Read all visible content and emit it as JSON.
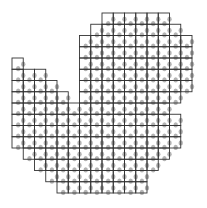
{
  "diagram": {
    "type": "grid-mask",
    "cell_size": 11.25,
    "origin": {
      "x": 12,
      "y": 13
    },
    "line_color": "#333333",
    "fill_color": "#ffffff",
    "dot_color": "#9a9a9a",
    "rows": [
      {
        "r": 0,
        "cols": [
          [
            8,
            13
          ]
        ]
      },
      {
        "r": 1,
        "cols": [
          [
            7,
            14
          ]
        ]
      },
      {
        "r": 2,
        "cols": [
          [
            6,
            15
          ]
        ]
      },
      {
        "r": 3,
        "cols": [
          [
            6,
            15
          ]
        ]
      },
      {
        "r": 4,
        "cols": [
          [
            0,
            0
          ],
          [
            6,
            15
          ]
        ]
      },
      {
        "r": 5,
        "cols": [
          [
            0,
            2
          ],
          [
            6,
            15
          ]
        ]
      },
      {
        "r": 6,
        "cols": [
          [
            0,
            3
          ],
          [
            6,
            15
          ]
        ]
      },
      {
        "r": 7,
        "cols": [
          [
            0,
            4
          ],
          [
            6,
            14
          ]
        ]
      },
      {
        "r": 8,
        "cols": [
          [
            0,
            13
          ]
        ]
      },
      {
        "r": 9,
        "cols": [
          [
            0,
            14
          ]
        ]
      },
      {
        "r": 10,
        "cols": [
          [
            0,
            14
          ]
        ]
      },
      {
        "r": 11,
        "cols": [
          [
            0,
            14
          ]
        ]
      },
      {
        "r": 12,
        "cols": [
          [
            1,
            13
          ]
        ]
      },
      {
        "r": 13,
        "cols": [
          [
            2,
            12
          ]
        ]
      },
      {
        "r": 14,
        "cols": [
          [
            3,
            11
          ]
        ]
      },
      {
        "r": 15,
        "cols": [
          [
            4,
            11
          ]
        ]
      }
    ]
  }
}
